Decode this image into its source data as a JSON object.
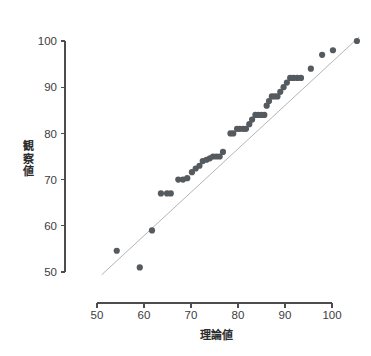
{
  "figure": {
    "name": "qq-plot",
    "background_color": "#ffffff",
    "dot_color": "#555a5e",
    "reference_line_color": "#b5b5b5",
    "axis_color": "#4d4d4d"
  },
  "chart_data": {
    "type": "scatter",
    "title": "",
    "subtitle": "",
    "xlabel": "理論値",
    "ylabel": "観察値",
    "ylabel_chars": [
      "観",
      "察",
      "値"
    ],
    "xlim": [
      50,
      106
    ],
    "ylim": [
      49,
      101
    ],
    "xticks": [
      50,
      60,
      70,
      80,
      90,
      100
    ],
    "yticks": [
      50,
      60,
      70,
      80,
      90,
      100
    ],
    "xtick_labels": [
      "50",
      "60",
      "70",
      "80",
      "90",
      "100"
    ],
    "ytick_labels": [
      "50",
      "60",
      "70",
      "80",
      "90",
      "100"
    ],
    "grid": false,
    "legend": "none",
    "marker_size_px": 3.1,
    "annotations": [],
    "reference_line": {
      "label": "y = x identity line",
      "x_start": 51.0,
      "y_start": 49.4,
      "x_end": 105.8,
      "y_end": 100.9
    },
    "series": [
      {
        "name": "観察値 vs 理論値",
        "points": [
          [
            54.2,
            54.6
          ],
          [
            59.1,
            51.0
          ],
          [
            61.7,
            59.0
          ],
          [
            63.6,
            67.0
          ],
          [
            64.9,
            67.0
          ],
          [
            65.7,
            67.0
          ],
          [
            67.3,
            70.0
          ],
          [
            68.3,
            70.0
          ],
          [
            69.2,
            70.3
          ],
          [
            70.2,
            71.6
          ],
          [
            71.0,
            72.4
          ],
          [
            71.8,
            73.0
          ],
          [
            72.5,
            74.0
          ],
          [
            73.3,
            74.3
          ],
          [
            74.0,
            74.6
          ],
          [
            74.7,
            75.0
          ],
          [
            75.4,
            75.0
          ],
          [
            76.1,
            75.0
          ],
          [
            76.8,
            76.0
          ],
          [
            78.4,
            80.0
          ],
          [
            79.0,
            80.0
          ],
          [
            79.8,
            81.0
          ],
          [
            80.4,
            81.0
          ],
          [
            81.1,
            81.0
          ],
          [
            81.7,
            81.0
          ],
          [
            82.4,
            82.0
          ],
          [
            83.0,
            83.0
          ],
          [
            83.7,
            84.0
          ],
          [
            84.3,
            84.0
          ],
          [
            85.0,
            84.0
          ],
          [
            85.6,
            84.0
          ],
          [
            86.1,
            86.0
          ],
          [
            86.6,
            87.0
          ],
          [
            87.2,
            88.0
          ],
          [
            87.8,
            88.0
          ],
          [
            88.4,
            88.0
          ],
          [
            89.0,
            89.0
          ],
          [
            89.7,
            90.0
          ],
          [
            90.4,
            91.0
          ],
          [
            91.1,
            92.0
          ],
          [
            91.8,
            92.0
          ],
          [
            92.6,
            92.0
          ],
          [
            93.4,
            92.0
          ],
          [
            95.5,
            94.0
          ],
          [
            97.9,
            97.0
          ],
          [
            100.2,
            98.0
          ],
          [
            105.3,
            100.0
          ]
        ]
      }
    ]
  }
}
